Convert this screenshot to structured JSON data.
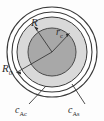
{
  "figure": {
    "kind": "concentric-circle-schematic",
    "background_color": "#fdfdfd",
    "stroke_color": "#3a3a3a",
    "regions": {
      "outer_ring_fill": "#ffffff",
      "middle_annulus_fill": "#d8d8d8",
      "inner_core_fill": "#a6a6a6"
    },
    "geometry": {
      "center_x": 52,
      "center_y": 52,
      "outer_circle_radius": 45,
      "second_circle_radius": 41,
      "middle_annulus_radius": 35,
      "inner_core_radius": 24
    }
  },
  "labels": {
    "radius_R": {
      "base": "R",
      "sub": ""
    },
    "radius_rc": {
      "base": "r",
      "sub": "c"
    },
    "radius_R0": {
      "base": "R",
      "sub": "0"
    },
    "concentration_core": {
      "base": "c",
      "sub": "Ac"
    },
    "concentration_surface": {
      "base": "c",
      "sub": "As"
    }
  },
  "leaders": {
    "R_arrow": "from center up-left to middle annulus boundary",
    "rc_arrow": "from center up-right to inner core boundary",
    "R0_arrow": "from center down-left to outer circle boundary",
    "cAc_leader": "from lower-left annulus down to c_Ac label",
    "cAs_leader": "from lower-right annulus down to c_As label"
  }
}
